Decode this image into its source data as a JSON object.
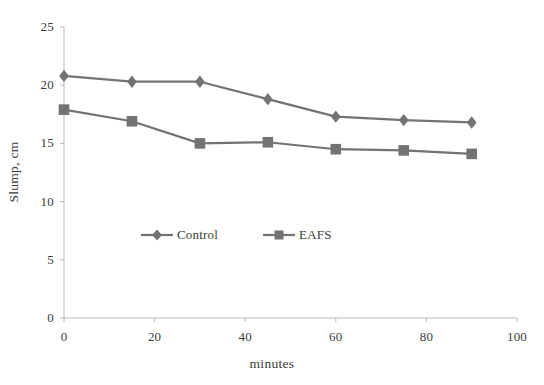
{
  "chart_data": {
    "type": "line",
    "title": "",
    "xlabel": "minutes",
    "ylabel": "Slump, cm",
    "x": [
      0,
      15,
      30,
      45,
      60,
      75,
      90
    ],
    "xlim": [
      0,
      100
    ],
    "ylim": [
      0,
      25
    ],
    "xticks": [
      0,
      20,
      40,
      60,
      80,
      100
    ],
    "yticks": [
      0,
      5,
      10,
      15,
      20,
      25
    ],
    "xtick_labels": [
      "0",
      "20",
      "40",
      "60",
      "80",
      "100"
    ],
    "ytick_labels": [
      "0",
      "5",
      "10",
      "15",
      "20",
      "25"
    ],
    "grid": false,
    "legend_position": "inside-center",
    "series": [
      {
        "name": "Control",
        "marker": "diamond",
        "color": "#737373",
        "values": [
          20.8,
          20.3,
          20.3,
          18.8,
          17.3,
          17.0,
          16.8
        ]
      },
      {
        "name": "EAFS",
        "marker": "square",
        "color": "#737373",
        "values": [
          17.9,
          16.9,
          15.0,
          15.1,
          14.5,
          14.4,
          14.1
        ]
      }
    ]
  },
  "axes": {
    "axis_color": "#b9b9b9",
    "tick_color": "#b9b9b9"
  },
  "legend": {
    "entries": [
      {
        "label": "Control",
        "marker": "diamond-icon"
      },
      {
        "label": "EAFS",
        "marker": "square-icon"
      }
    ]
  }
}
